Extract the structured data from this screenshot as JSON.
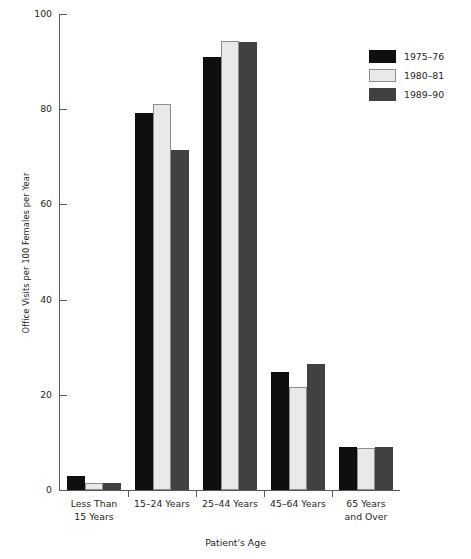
{
  "chart_data": {
    "type": "bar",
    "title": "",
    "xlabel": "Patient's Age",
    "ylabel": "Office Visits per 100 Females per Year",
    "ylim": [
      0,
      100
    ],
    "yticks": [
      0,
      20,
      40,
      60,
      80,
      100
    ],
    "grid": false,
    "legend_position": "top-right",
    "categories": [
      "Less Than 15 Years",
      "15–24 Years",
      "25–44 Years",
      "45–64 Years",
      "65 Years and Over"
    ],
    "category_lines": [
      [
        "Less Than",
        "15 Years"
      ],
      [
        "15–24 Years"
      ],
      [
        "25–44 Years"
      ],
      [
        "45–64 Years"
      ],
      [
        "65 Years",
        "and Over"
      ]
    ],
    "series": [
      {
        "name": "1975–76",
        "color": "#100f0f",
        "values": [
          3.0,
          79.3,
          91.0,
          24.8,
          9.0
        ]
      },
      {
        "name": "1980–81",
        "color": "#e9e9e7",
        "values": [
          1.5,
          81.0,
          94.3,
          21.7,
          8.8
        ]
      },
      {
        "name": "1989–90",
        "color": "#414042",
        "values": [
          1.4,
          71.4,
          94.1,
          26.5,
          9.1
        ]
      }
    ]
  }
}
